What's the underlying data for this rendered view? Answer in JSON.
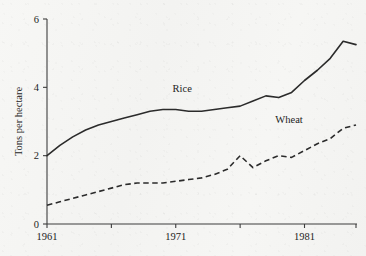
{
  "chart_data": {
    "type": "line",
    "title": "",
    "xlabel": "",
    "ylabel": "Tons per hectare",
    "xlim": [
      1961,
      1985
    ],
    "ylim": [
      0,
      6
    ],
    "grid": false,
    "legend_position": "inline-annotations",
    "y_ticks": [
      "0",
      "2",
      "4",
      "6"
    ],
    "y_tick_values": [
      0,
      2,
      4,
      6
    ],
    "x_ticks": [
      "1961",
      "",
      "1971",
      "",
      "1981",
      ""
    ],
    "x_tick_values": [
      1961,
      1966,
      1971,
      1976,
      1981,
      1985
    ],
    "x_tick_labels_shown": [
      "1961",
      "1971",
      "1981"
    ],
    "x": [
      1961,
      1962,
      1963,
      1964,
      1965,
      1966,
      1967,
      1968,
      1969,
      1970,
      1971,
      1972,
      1973,
      1974,
      1975,
      1976,
      1977,
      1978,
      1979,
      1980,
      1981,
      1982,
      1983,
      1984,
      1985
    ],
    "series": [
      {
        "name": "Rice",
        "style": "solid",
        "label_x": 1971.5,
        "label_y": 3.85,
        "values": [
          2.0,
          2.3,
          2.55,
          2.75,
          2.9,
          3.0,
          3.1,
          3.2,
          3.3,
          3.35,
          3.35,
          3.3,
          3.3,
          3.35,
          3.4,
          3.45,
          3.6,
          3.75,
          3.7,
          3.85,
          4.2,
          4.5,
          4.85,
          5.35,
          5.25
        ]
      },
      {
        "name": "Wheat",
        "style": "dashed",
        "label_x": 1979.8,
        "label_y": 2.95,
        "values": [
          0.55,
          0.65,
          0.75,
          0.85,
          0.95,
          1.05,
          1.15,
          1.2,
          1.2,
          1.2,
          1.25,
          1.3,
          1.35,
          1.45,
          1.6,
          2.0,
          1.65,
          1.85,
          2.0,
          1.95,
          2.15,
          2.35,
          2.5,
          2.8,
          2.9
        ]
      }
    ]
  },
  "axis_color": "#3d3d3d",
  "line_color": "#2b2b2b",
  "background_color": "#f6f6f4"
}
